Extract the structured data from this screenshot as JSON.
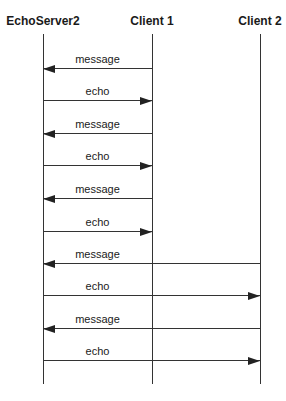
{
  "diagram": {
    "type": "sequence",
    "actors": [
      {
        "name": "EchoServer2",
        "x": 43
      },
      {
        "name": "Client 1",
        "x": 152
      },
      {
        "name": "Client 2",
        "x": 260
      }
    ],
    "messages": [
      {
        "label": "message",
        "from": "Client 1",
        "to": "EchoServer2",
        "y": 68
      },
      {
        "label": "echo",
        "from": "EchoServer2",
        "to": "Client 1",
        "y": 100
      },
      {
        "label": "message",
        "from": "Client 1",
        "to": "EchoServer2",
        "y": 133
      },
      {
        "label": "echo",
        "from": "EchoServer2",
        "to": "Client 1",
        "y": 165
      },
      {
        "label": "message",
        "from": "Client 1",
        "to": "EchoServer2",
        "y": 198
      },
      {
        "label": "echo",
        "from": "EchoServer2",
        "to": "Client 1",
        "y": 231
      },
      {
        "label": "message",
        "from": "Client 2",
        "to": "EchoServer2",
        "y": 263
      },
      {
        "label": "echo",
        "from": "EchoServer2",
        "to": "Client 2",
        "y": 295
      },
      {
        "label": "message",
        "from": "Client 2",
        "to": "EchoServer2",
        "y": 328
      },
      {
        "label": "echo",
        "from": "EchoServer2",
        "to": "Client 2",
        "y": 360
      }
    ]
  }
}
